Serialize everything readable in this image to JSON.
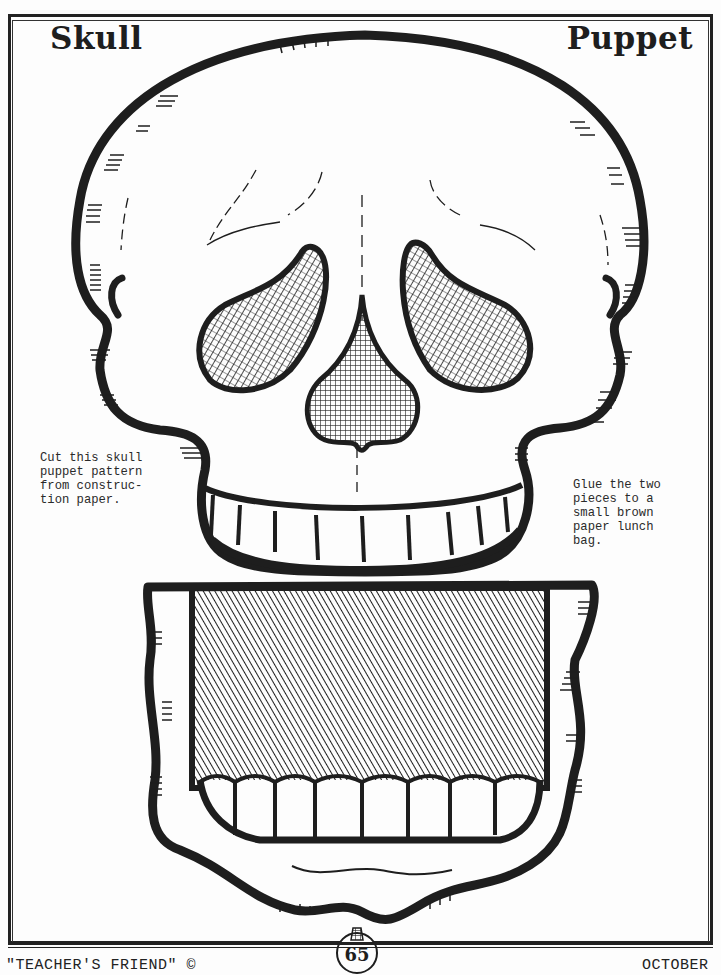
{
  "header": {
    "title_left": "Skull",
    "title_right": "Puppet"
  },
  "instructions": {
    "left": "Cut this skull\npuppet pattern\nfrom construc-\ntion paper.",
    "right": "Glue the two\npieces to a\nsmall brown\npaper lunch\nbag."
  },
  "footer": {
    "publisher": "\"TEACHER'S FRIEND\" ©",
    "page_number": "65",
    "month": "OCTOBER",
    "page_marker_icon": "apple-icon"
  },
  "artwork": {
    "upper_piece": "skull-head-with-upper-teeth",
    "lower_piece": "skull-jaw-with-lower-teeth",
    "line_color": "#1e1e1e",
    "paper_color": "#fdfdfd"
  }
}
